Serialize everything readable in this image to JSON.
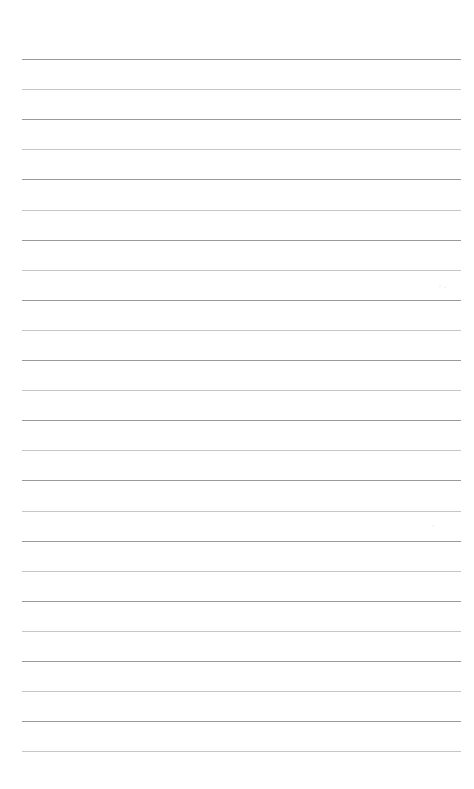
{
  "page": {
    "name": "ruled-notepaper",
    "width": 474,
    "height": 789,
    "background_color": "#ffffff",
    "orientation": "portrait",
    "content_text": ""
  },
  "ruling": {
    "style": "college-ruled",
    "line_count": 24,
    "first_line_y": 59,
    "line_spacing": 30.1,
    "line_left_x": 22,
    "line_right_x": 461,
    "line_width": 439,
    "line_thickness": 1,
    "dark_line_color": "#9a9a9a",
    "light_line_color": "#c6c6c6",
    "top_margin": 59,
    "bottom_margin": 38,
    "left_margin": 22,
    "right_margin": 13,
    "has_vertical_margin_rule": false,
    "has_header_text": false,
    "has_holes": false
  },
  "lines": [
    {
      "index": 1,
      "y": 59.0,
      "tone": "dark"
    },
    {
      "index": 2,
      "y": 89.1,
      "tone": "light"
    },
    {
      "index": 3,
      "y": 119.2,
      "tone": "dark"
    },
    {
      "index": 4,
      "y": 149.3,
      "tone": "light"
    },
    {
      "index": 5,
      "y": 179.4,
      "tone": "dark"
    },
    {
      "index": 6,
      "y": 209.5,
      "tone": "light"
    },
    {
      "index": 7,
      "y": 239.6,
      "tone": "dark"
    },
    {
      "index": 8,
      "y": 269.7,
      "tone": "light"
    },
    {
      "index": 9,
      "y": 299.8,
      "tone": "dark"
    },
    {
      "index": 10,
      "y": 329.9,
      "tone": "light"
    },
    {
      "index": 11,
      "y": 360.0,
      "tone": "dark"
    },
    {
      "index": 12,
      "y": 390.1,
      "tone": "light"
    },
    {
      "index": 13,
      "y": 420.2,
      "tone": "dark"
    },
    {
      "index": 14,
      "y": 450.3,
      "tone": "light"
    },
    {
      "index": 15,
      "y": 480.4,
      "tone": "dark"
    },
    {
      "index": 16,
      "y": 510.5,
      "tone": "light"
    },
    {
      "index": 17,
      "y": 540.6,
      "tone": "dark"
    },
    {
      "index": 18,
      "y": 570.7,
      "tone": "light"
    },
    {
      "index": 19,
      "y": 600.8,
      "tone": "dark"
    },
    {
      "index": 20,
      "y": 630.9,
      "tone": "light"
    },
    {
      "index": 21,
      "y": 661.0,
      "tone": "dark"
    },
    {
      "index": 22,
      "y": 691.1,
      "tone": "light"
    },
    {
      "index": 23,
      "y": 721.2,
      "tone": "dark"
    },
    {
      "index": 24,
      "y": 751.3,
      "tone": "light"
    }
  ],
  "artifacts": [
    {
      "name": "speckle-upper-right",
      "x": 439,
      "y": 285,
      "size": 2
    },
    {
      "name": "speckle-upper-right-2",
      "x": 444,
      "y": 286,
      "size": 2
    },
    {
      "name": "speckle-mid-right",
      "x": 432,
      "y": 525,
      "size": 2
    }
  ],
  "writing_slots": {
    "placeholder": ""
  }
}
